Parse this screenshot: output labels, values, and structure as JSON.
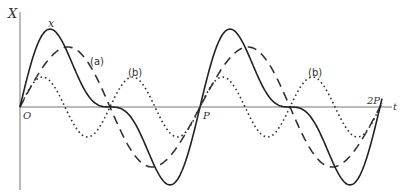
{
  "diagram": {
    "title": "",
    "axes": {
      "y_label": "X",
      "x_label": "t",
      "origin_label": "O",
      "tick_labels": [
        "P",
        "2P"
      ]
    },
    "curves": [
      {
        "id": "x",
        "label": "x",
        "style": "solid",
        "description": "resultant periodic wave with flat inflections"
      },
      {
        "id": "a",
        "label": "(a)",
        "style": "dashed",
        "description": "fundamental sinusoid, period P"
      },
      {
        "id": "b",
        "label": "(b)",
        "style": "dotted",
        "description": "second harmonic, period P/2"
      }
    ],
    "labels": {
      "b_second": "(b)"
    },
    "colors": {
      "ink": "#222222",
      "axis": "#666666",
      "background": "#ffffff"
    }
  }
}
